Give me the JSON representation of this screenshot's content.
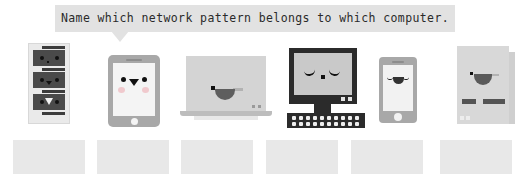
{
  "prompt": {
    "text": "Name which network pattern belongs to which computer.",
    "bubble_color": "#e2e2e2",
    "text_color": "#2a2a2a"
  },
  "devices": [
    {
      "id": "server-tower",
      "label": "server tower",
      "face": "two round eyes, small triangular mouth",
      "color": "#eaeaea",
      "accent": "#4a4a4a"
    },
    {
      "id": "tablet",
      "label": "tablet",
      "face": "two round eyes, triangular mouth, pink cheeks",
      "color": "#a8a8a8",
      "accent": "#f0c9cd"
    },
    {
      "id": "laptop",
      "label": "laptop",
      "face": "one dot eye, one dash brow, wide open mouth",
      "color": "#d4d4d4",
      "accent": "#5e5e5e"
    },
    {
      "id": "desktop",
      "label": "desktop computer with keyboard",
      "face": "two closed curved eyes, square nose",
      "color": "#2b2b2b",
      "accent": "#c9c9c9"
    },
    {
      "id": "smartphone",
      "label": "smartphone",
      "face": "two closed curved eyes, smiling mouth",
      "color": "#a8a8a8",
      "accent": "#f2f2f2"
    },
    {
      "id": "notebook",
      "label": "notebook computer",
      "face": "one dot eye, one dash brow, wide open mouth",
      "color": "#d8d8d8",
      "accent": "#545454"
    }
  ],
  "answer_boxes": [
    {
      "id": "answer-1",
      "value": "",
      "left": 13
    },
    {
      "id": "answer-2",
      "value": "",
      "left": 97
    },
    {
      "id": "answer-3",
      "value": "",
      "left": 181
    },
    {
      "id": "answer-4",
      "value": "",
      "left": 266
    },
    {
      "id": "answer-5",
      "value": "",
      "left": 351
    },
    {
      "id": "answer-6",
      "value": "",
      "left": 440
    }
  ]
}
